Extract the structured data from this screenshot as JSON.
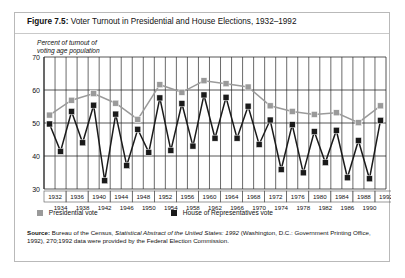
{
  "figure": {
    "label": "Figure 7.5:",
    "title": "Voter Turnout in Presidential and House Elections, 1932–1992",
    "axis_caption_line1": "Percent of turnout of",
    "axis_caption_line2": "voting age population"
  },
  "legend": {
    "presidential": "Presidential vote",
    "house": "House of Representatives vote",
    "presidential_color": "#9a9a9a",
    "house_color": "#1a1a1a"
  },
  "source": {
    "label": "Source:",
    "text_before": " Bureau of the Census, ",
    "italic_title": "Statistical Abstract of the United States: 1992",
    "text_after": " (Washington, D.C.: Government Printing Office, 1992), 270;1992 data were provided by the Federal Election Commission."
  },
  "chart_data": {
    "type": "line",
    "title": "Voter Turnout in Presidential and House Elections, 1932–1992",
    "xlabel": "",
    "ylabel": "Percent of turnout of voting age population",
    "ylim": [
      30,
      70
    ],
    "yticks": [
      30,
      40,
      50,
      60,
      70
    ],
    "grid": true,
    "legend_position": "below",
    "x": [
      1932,
      1934,
      1936,
      1938,
      1940,
      1942,
      1944,
      1946,
      1948,
      1950,
      1952,
      1954,
      1956,
      1958,
      1960,
      1962,
      1964,
      1966,
      1968,
      1970,
      1972,
      1974,
      1976,
      1978,
      1980,
      1982,
      1984,
      1986,
      1988,
      1990,
      1992
    ],
    "xticks_presidential": [
      1932,
      1936,
      1940,
      1944,
      1948,
      1952,
      1956,
      1960,
      1964,
      1968,
      1972,
      1976,
      1980,
      1984,
      1988,
      1992
    ],
    "xticks_midterm": [
      1934,
      1938,
      1942,
      1946,
      1950,
      1954,
      1958,
      1962,
      1966,
      1970,
      1974,
      1978,
      1982,
      1986,
      1990
    ],
    "series": [
      {
        "name": "Presidential vote",
        "color": "#9a9a9a",
        "marker": "square",
        "points": [
          {
            "year": 1932,
            "value": 52.4
          },
          {
            "year": 1936,
            "value": 56.9
          },
          {
            "year": 1940,
            "value": 58.9
          },
          {
            "year": 1944,
            "value": 56.0
          },
          {
            "year": 1948,
            "value": 51.1
          },
          {
            "year": 1952,
            "value": 61.6
          },
          {
            "year": 1956,
            "value": 59.3
          },
          {
            "year": 1960,
            "value": 62.8
          },
          {
            "year": 1964,
            "value": 61.9
          },
          {
            "year": 1968,
            "value": 60.9
          },
          {
            "year": 1972,
            "value": 55.2
          },
          {
            "year": 1976,
            "value": 53.5
          },
          {
            "year": 1980,
            "value": 52.6
          },
          {
            "year": 1984,
            "value": 53.1
          },
          {
            "year": 1988,
            "value": 50.1
          },
          {
            "year": 1992,
            "value": 55.2
          }
        ]
      },
      {
        "name": "House of Representatives vote",
        "color": "#1a1a1a",
        "marker": "square",
        "points": [
          {
            "year": 1932,
            "value": 49.7
          },
          {
            "year": 1934,
            "value": 41.4
          },
          {
            "year": 1936,
            "value": 53.5
          },
          {
            "year": 1938,
            "value": 44.0
          },
          {
            "year": 1940,
            "value": 55.4
          },
          {
            "year": 1942,
            "value": 32.5
          },
          {
            "year": 1944,
            "value": 52.7
          },
          {
            "year": 1946,
            "value": 37.1
          },
          {
            "year": 1948,
            "value": 48.1
          },
          {
            "year": 1950,
            "value": 41.1
          },
          {
            "year": 1952,
            "value": 57.6
          },
          {
            "year": 1954,
            "value": 41.7
          },
          {
            "year": 1956,
            "value": 55.9
          },
          {
            "year": 1958,
            "value": 43.0
          },
          {
            "year": 1960,
            "value": 58.5
          },
          {
            "year": 1962,
            "value": 45.4
          },
          {
            "year": 1964,
            "value": 57.8
          },
          {
            "year": 1966,
            "value": 45.4
          },
          {
            "year": 1968,
            "value": 55.1
          },
          {
            "year": 1970,
            "value": 43.5
          },
          {
            "year": 1972,
            "value": 50.9
          },
          {
            "year": 1974,
            "value": 35.9
          },
          {
            "year": 1976,
            "value": 49.5
          },
          {
            "year": 1978,
            "value": 34.9
          },
          {
            "year": 1980,
            "value": 47.4
          },
          {
            "year": 1982,
            "value": 38.0
          },
          {
            "year": 1984,
            "value": 47.8
          },
          {
            "year": 1986,
            "value": 33.4
          },
          {
            "year": 1988,
            "value": 44.7
          },
          {
            "year": 1990,
            "value": 33.1
          },
          {
            "year": 1992,
            "value": 50.8
          }
        ]
      }
    ]
  }
}
